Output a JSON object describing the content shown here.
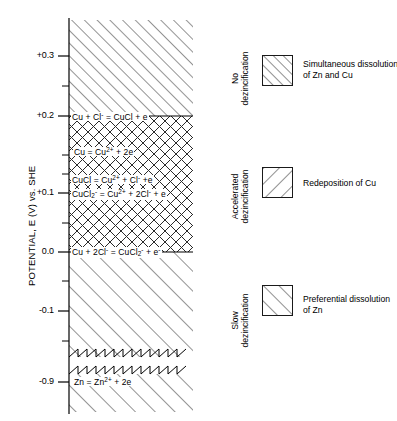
{
  "figure": {
    "type": "potential-region-diagram",
    "axis_title": "POTENTIAL, E (V) vs. SHE"
  },
  "chart_data": {
    "type": "line",
    "title": "POTENTIAL, E (V) vs. SHE",
    "ylabel": "POTENTIAL, E (V) vs. SHE",
    "xlabel": "",
    "grid": false,
    "legend_position": "right",
    "ylim": [
      -0.95,
      0.37
    ],
    "ytick_labels": [
      "+0.3",
      "+0.2",
      "+0.1",
      "0.0",
      "-0.1",
      "-0.9"
    ],
    "ytick_values": [
      0.3,
      0.2,
      0.1,
      0.0,
      -0.1,
      -0.9
    ],
    "axis_break": {
      "present": true,
      "between": [
        -0.1,
        -0.9
      ],
      "style": "double-zigzag"
    },
    "boundary_lines": [
      {
        "value": 0.2,
        "label": "Cu + Cl- = CuCl + e"
      },
      {
        "value": 0.0,
        "label": "Cu + 2Cl- = CuCl2- + e-"
      }
    ],
    "annotations": [
      {
        "value": 0.2,
        "text": "Cu + Cl- = CuCl + e"
      },
      {
        "value": 0.163,
        "text": "Cu = Cu2+ + 2e"
      },
      {
        "value": 0.118,
        "text": "CuCl = Cu2+ + Cl- + e"
      },
      {
        "value": 0.1,
        "text": "CuCl2- = Cu2+ + 2Cl- + e"
      },
      {
        "value": 0.0,
        "text": "Cu + 2Cl- = CuCl2- + e-"
      },
      {
        "value": -0.9,
        "text": "Zn = Zn2+ + 2e"
      }
    ],
    "regions": [
      {
        "name": "No dezincification",
        "from": 0.2,
        "to": 0.37,
        "hatch": "forward-slash",
        "legend": "Simultaneous dissolution of Zn and Cu"
      },
      {
        "name": "Accelerated dezincification",
        "from": 0.0,
        "to": 0.2,
        "hatch": "cross-hatch",
        "legend": "Redeposition of Cu"
      },
      {
        "name": "Slow dezincification",
        "from": -0.95,
        "to": 0.0,
        "hatch": "forward-slash-wide",
        "legend": "Preferential dissolution of Zn"
      }
    ]
  },
  "axis": {
    "title": "POTENTIAL, E (V) vs. SHE",
    "ticks": [
      {
        "label": "+0.3",
        "y": 56
      },
      {
        "label": "+0.2",
        "y": 116
      },
      {
        "label": "+0.1",
        "y": 193
      },
      {
        "label": "0.0",
        "y": 252
      },
      {
        "label": "-0.1",
        "y": 311
      },
      {
        "label": "-0.9",
        "y": 382
      }
    ],
    "minor_ticks_y": [
      86,
      155,
      174,
      223,
      281,
      341,
      357
    ]
  },
  "equations": [
    {
      "id": "eq-cu-cl-cucl",
      "html": "Cu + Cl<sup>-</sup> = CuCl + e",
      "x": 71,
      "y": 112
    },
    {
      "id": "eq-cu-cu2",
      "html": "Cu = Cu<sup>2+</sup> + 2e",
      "x": 73,
      "y": 147
    },
    {
      "id": "eq-cucl-cu2",
      "html": "CuCl = Cu<sup>2+</sup> + Cl<sup>-</sup> +e",
      "x": 71,
      "y": 175
    },
    {
      "id": "eq-cucl2-cu2",
      "html": "CuCl<sub>2</sub><sup>-</sup> = Cu<sup>2+</sup> + 2Cl<sup>-</sup> + e",
      "x": 71,
      "y": 189
    },
    {
      "id": "eq-cu-2cl-cucl2",
      "html": "Cu + 2Cl<sup>-</sup> = CuCl<sub>2</sub><sup>-</sup> + e<sup>-</sup>",
      "x": 71,
      "y": 247
    },
    {
      "id": "eq-zn-zn2",
      "html": "Zn = Zn<sup>2+</sup> + 2e",
      "x": 73,
      "y": 377
    }
  ],
  "region_labels": [
    {
      "id": "region-no-dezincification",
      "line1": "No",
      "line2": "dezincification",
      "cx": 213,
      "cy": 68
    },
    {
      "id": "region-accelerated-dezincification",
      "line1": "Accelerated",
      "line2": "dezincification",
      "cx": 213,
      "cy": 186
    },
    {
      "id": "region-slow-dezincification",
      "line1": "Slow",
      "line2": "dezincification",
      "cx": 213,
      "cy": 310
    }
  ],
  "legend": {
    "items": [
      {
        "id": "legend-simultaneous-dissolution",
        "hatch": "forward-slash",
        "line1": "Simultaneous dissolution",
        "line2": "of Zn and Cu",
        "sx": 262,
        "sy": 55,
        "tx": 303,
        "ty": 59
      },
      {
        "id": "legend-redeposition-cu",
        "hatch": "back-slash",
        "line1": "Redeposition of Cu",
        "line2": "",
        "sx": 262,
        "sy": 167,
        "tx": 303,
        "ty": 178
      },
      {
        "id": "legend-preferential-dissolution",
        "hatch": "forward-slash-wide",
        "line1": "Preferential dissolution",
        "line2": "of Zn",
        "sx": 262,
        "sy": 285,
        "tx": 303,
        "ty": 294
      }
    ]
  }
}
